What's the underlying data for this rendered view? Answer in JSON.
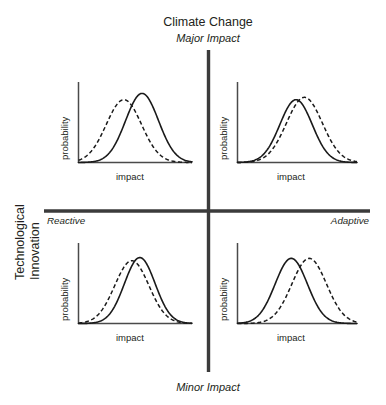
{
  "figure": {
    "background_color": "#ffffff",
    "line_color": "#231f20",
    "axis_color": "#3b3b3b"
  },
  "axes": {
    "vertical": {
      "title": "Climate Change",
      "top_label": "Major Impact",
      "bottom_label": "Minor Impact"
    },
    "horizontal": {
      "title_line1": "Technological",
      "title_line2": "Innovation",
      "left_label": "Reactive",
      "right_label": "Adaptive"
    }
  },
  "quadrants": [
    {
      "id": "top-left",
      "position": "Major Impact / Reactive",
      "xlabel": "impact",
      "ylabel": "probability"
    },
    {
      "id": "top-right",
      "position": "Major Impact / Adaptive",
      "xlabel": "impact",
      "ylabel": "probability"
    },
    {
      "id": "bottom-left",
      "position": "Minor Impact / Reactive",
      "xlabel": "impact",
      "ylabel": "probability"
    },
    {
      "id": "bottom-right",
      "position": "Minor Impact / Adaptive",
      "xlabel": "impact",
      "ylabel": "probability"
    }
  ],
  "chart_data": {
    "type": "line",
    "title": "Climate Change",
    "subtitle": "Technological Innovation",
    "layout": "2x2 quadrant matrix of probability distributions",
    "xlabel": "impact",
    "ylabel": "probability",
    "grid": false,
    "legend": null,
    "axis_annotations": {
      "vertical_top": "Major Impact",
      "vertical_bottom": "Minor Impact",
      "horizontal_left": "Reactive",
      "horizontal_right": "Adaptive"
    },
    "panels": [
      {
        "name": "top-left",
        "quadrant": "Major Impact / Reactive",
        "series": [
          {
            "name": "dashed",
            "style": "dashed",
            "mean": 0.4,
            "sigma": 0.155,
            "peak_height": 0.8
          },
          {
            "name": "solid",
            "style": "solid",
            "mean": 0.56,
            "sigma": 0.145,
            "peak_height": 0.88
          }
        ]
      },
      {
        "name": "top-right",
        "quadrant": "Major Impact / Adaptive",
        "series": [
          {
            "name": "solid",
            "style": "solid",
            "mean": 0.49,
            "sigma": 0.135,
            "peak_height": 0.8
          },
          {
            "name": "dashed",
            "style": "dashed",
            "mean": 0.56,
            "sigma": 0.15,
            "peak_height": 0.83
          }
        ]
      },
      {
        "name": "bottom-left",
        "quadrant": "Minor Impact / Reactive",
        "series": [
          {
            "name": "dashed",
            "style": "dashed",
            "mean": 0.47,
            "sigma": 0.15,
            "peak_height": 0.8
          },
          {
            "name": "solid",
            "style": "solid",
            "mean": 0.54,
            "sigma": 0.135,
            "peak_height": 0.84
          }
        ]
      },
      {
        "name": "bottom-right",
        "quadrant": "Minor Impact / Adaptive",
        "series": [
          {
            "name": "solid",
            "style": "solid",
            "mean": 0.45,
            "sigma": 0.135,
            "peak_height": 0.83
          },
          {
            "name": "dashed",
            "style": "dashed",
            "mean": 0.6,
            "sigma": 0.145,
            "peak_height": 0.83
          }
        ]
      }
    ]
  }
}
